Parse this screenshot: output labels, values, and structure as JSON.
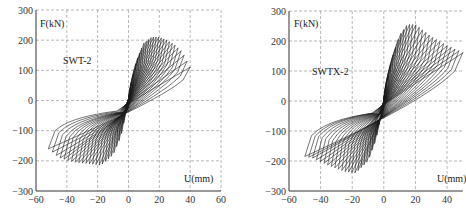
{
  "chart_data": [
    {
      "type": "line",
      "title": "SWT-2",
      "xlabel": "U(mm)",
      "ylabel": "F(kN)",
      "xlim": [
        -60,
        60
      ],
      "ylim": [
        -300,
        300
      ],
      "xticks": [
        -60,
        -40,
        -20,
        0,
        20,
        40,
        60
      ],
      "yticks": [
        300,
        200,
        100,
        0,
        -100,
        -200,
        -300
      ],
      "grid": true,
      "description": "Hysteresis loops (load-displacement), cyclic loading",
      "envelope": {
        "x": [
          -52,
          -45,
          -35,
          -25,
          -18,
          -10,
          -5,
          0,
          5,
          10,
          15,
          20,
          25,
          30,
          35,
          40
        ],
        "y": [
          -160,
          -190,
          -205,
          -210,
          -215,
          -180,
          -120,
          0,
          130,
          190,
          210,
          210,
          200,
          185,
          160,
          110
        ]
      }
    },
    {
      "type": "line",
      "title": "SWTX-2",
      "xlabel": "U(mm)",
      "ylabel": "F(kN)",
      "xlim": [
        -60,
        50
      ],
      "ylim": [
        -300,
        300
      ],
      "xticks": [
        -60,
        -40,
        -20,
        0,
        20,
        40
      ],
      "yticks": [
        300,
        200,
        100,
        0,
        -100,
        -200,
        -300
      ],
      "grid": true,
      "description": "Hysteresis loops (load-displacement), cyclic loading",
      "envelope": {
        "x": [
          -50,
          -45,
          -35,
          -25,
          -18,
          -10,
          -5,
          0,
          5,
          10,
          15,
          20,
          25,
          30,
          40,
          50
        ],
        "y": [
          -185,
          -190,
          -215,
          -235,
          -240,
          -200,
          -130,
          0,
          140,
          220,
          255,
          255,
          235,
          215,
          185,
          160
        ]
      }
    }
  ],
  "charts": [
    {
      "id": "left",
      "label": "SWT-2",
      "ylabel": "F(kN)",
      "xlabel": "U(mm)",
      "yticks": [
        "300",
        "200",
        "100",
        "0",
        "−100",
        "−200",
        "−300"
      ],
      "xticks": [
        "−60",
        "−40",
        "−20",
        "0",
        "20",
        "40",
        "60"
      ]
    },
    {
      "id": "right",
      "label": "SWTX-2",
      "ylabel": "F(kN)",
      "xlabel": "U(mm)",
      "yticks": [
        "300",
        "200",
        "100",
        "0",
        "−100",
        "−200",
        "−300"
      ],
      "xticks": [
        "−60",
        "−40",
        "−20",
        "0",
        "20",
        "40"
      ]
    }
  ]
}
